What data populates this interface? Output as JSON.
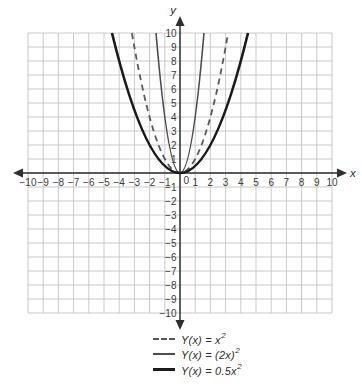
{
  "colors": {
    "background": "#ffffff",
    "grid": "#c4c4c4",
    "axis": "#2f2f2f",
    "tick_text": "#3a3a3a",
    "curve_dashed": "#595959",
    "curve_thin": "#4d4d4d",
    "curve_thick": "#1a1a1a"
  },
  "chart_data": {
    "type": "line",
    "title": "",
    "xlabel": "x",
    "ylabel": "y",
    "xlim": [
      -10,
      10
    ],
    "ylim": [
      -10,
      10
    ],
    "grid": true,
    "legend_position": "bottom",
    "origin_label": "0",
    "x_ticks": [
      -10,
      -9,
      -8,
      -7,
      -6,
      -5,
      -4,
      -3,
      -2,
      -1,
      0,
      1,
      2,
      3,
      4,
      5,
      6,
      7,
      8,
      9,
      10
    ],
    "y_ticks": [
      -10,
      -9,
      -8,
      -7,
      -6,
      -5,
      -4,
      -3,
      -2,
      -1,
      0,
      1,
      2,
      3,
      4,
      5,
      6,
      7,
      8,
      9,
      10
    ],
    "series": [
      {
        "name": "Y(x) = x²",
        "equation": "Y(x) = x^2",
        "coefficient": 1,
        "style": "dashed",
        "dash": "6 4.5",
        "color": "#595959",
        "width": 1.8,
        "label_main": "Y(x) = x",
        "label_sup": "2",
        "visible_x_range": [
          -3.16,
          3.16
        ],
        "points": [
          [
            -3,
            9
          ],
          [
            -2,
            4
          ],
          [
            -1,
            1
          ],
          [
            0,
            0
          ],
          [
            1,
            1
          ],
          [
            2,
            4
          ],
          [
            3,
            9
          ]
        ]
      },
      {
        "name": "Y(x) = (2x)²",
        "equation": "Y(x) = (2x)^2",
        "coefficient": 4,
        "style": "solid",
        "dash": "",
        "color": "#4d4d4d",
        "width": 1.6,
        "label_main": "Y(x) = (2x)",
        "label_sup": "2",
        "visible_x_range": [
          -1.58,
          1.58
        ],
        "points": [
          [
            -1.5,
            9
          ],
          [
            -1,
            4
          ],
          [
            -0.5,
            1
          ],
          [
            0,
            0
          ],
          [
            0.5,
            1
          ],
          [
            1,
            4
          ],
          [
            1.5,
            9
          ]
        ]
      },
      {
        "name": "Y(x) = 0.5x²",
        "equation": "Y(x) = 0.5x^2",
        "coefficient": 0.5,
        "style": "solid",
        "dash": "",
        "color": "#1a1a1a",
        "width": 2.6,
        "label_main": "Y(x) = 0.5x",
        "label_sup": "2",
        "visible_x_range": [
          -4.47,
          4.47
        ],
        "points": [
          [
            -4,
            8
          ],
          [
            -3,
            4.5
          ],
          [
            -2,
            2
          ],
          [
            -1,
            0.5
          ],
          [
            0,
            0
          ],
          [
            1,
            0.5
          ],
          [
            2,
            2
          ],
          [
            3,
            4.5
          ],
          [
            4,
            8
          ]
        ]
      }
    ]
  }
}
